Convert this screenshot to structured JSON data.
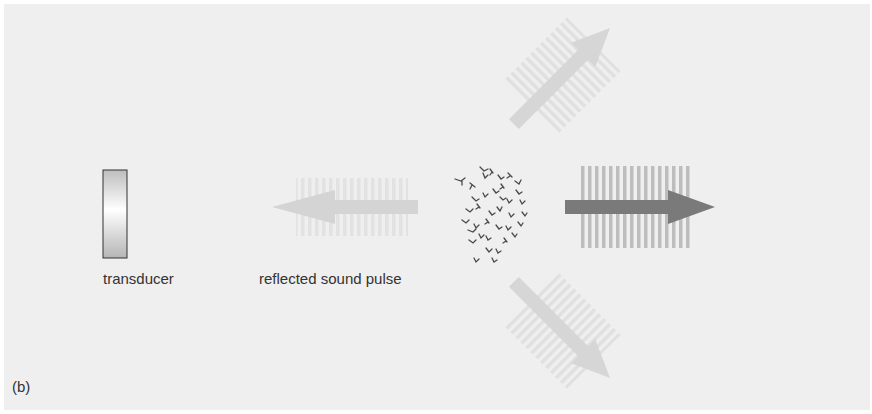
{
  "figure": {
    "panel_label": "(b)",
    "background_color": "#efefef"
  },
  "transducer": {
    "label": "transducer",
    "icon": "transducer-rectangle"
  },
  "reflected_pulse": {
    "label": "reflected sound pulse",
    "direction": "left",
    "color": "#d4d4d4"
  },
  "scatterers": {
    "icon": "particle-cluster",
    "color": "#4a4a4a"
  },
  "transmitted_pulse": {
    "direction": "right",
    "color": "#7a7a7a"
  },
  "scattered_pulses": [
    {
      "direction": "up-right",
      "color": "#d6d6d6"
    },
    {
      "direction": "down-right",
      "color": "#d6d6d6"
    }
  ]
}
